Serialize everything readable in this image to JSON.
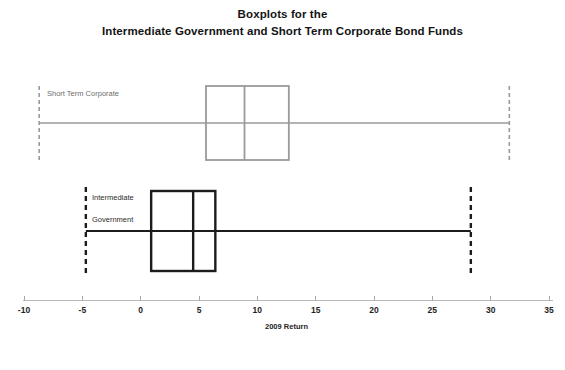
{
  "chart_data": {
    "type": "box",
    "title": "Boxplots for the Intermediate Government and Short Term Corporate Bond Funds",
    "title_line1": "Boxplots for the",
    "title_line2": "Intermediate Government and Short Term Corporate Bond Funds",
    "xlabel": "2009 Return",
    "ylabel": "",
    "xlim": [
      -12,
      37
    ],
    "xticks": [
      -10,
      -5,
      0,
      5,
      10,
      15,
      20,
      25,
      30,
      35
    ],
    "xticklabels": [
      "-10",
      "-5",
      "0",
      "5",
      "10",
      "15",
      "20",
      "25",
      "30",
      "35"
    ],
    "grid": false,
    "legend": "none",
    "orientation": "horizontal",
    "boxes": [
      {
        "name": "Short Term Corporate",
        "label_lines": [
          "Short Term Corporate"
        ],
        "color": "#9a9a9a",
        "min": -8.7,
        "q1": 5.6,
        "median": 8.9,
        "q3": 12.7,
        "max": 31.6
      },
      {
        "name": "Intermediate Government",
        "label_lines": [
          "Intermediate",
          "Government"
        ],
        "color": "#1c1c1c",
        "min": -4.7,
        "q1": 0.9,
        "median": 4.5,
        "q3": 6.4,
        "max": 28.3
      }
    ]
  },
  "chart": {
    "title_line1": "Boxplots for the",
    "title_line2": "Intermediate Government and Short Term Corporate Bond Funds",
    "axis_title": "2009 Return",
    "ticks": [
      {
        "label": "-10"
      },
      {
        "label": "-5"
      },
      {
        "label": "0"
      },
      {
        "label": "5"
      },
      {
        "label": "10"
      },
      {
        "label": "15"
      },
      {
        "label": "20"
      },
      {
        "label": "25"
      },
      {
        "label": "30"
      },
      {
        "label": "35"
      }
    ],
    "series": [
      {
        "label": "Short Term Corporate"
      },
      {
        "label_line1": "Intermediate",
        "label_line2": "Government"
      }
    ]
  }
}
